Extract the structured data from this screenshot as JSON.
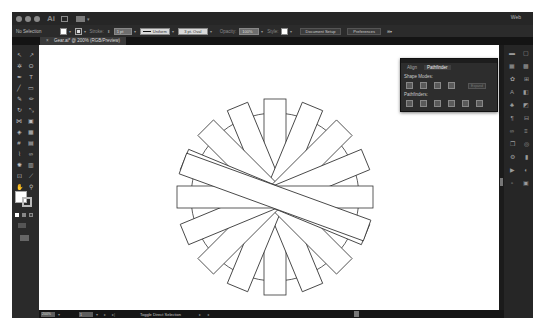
{
  "app": {
    "name": "Ai",
    "workspace": "Web"
  },
  "control_bar": {
    "selection_label": "No Selection",
    "stroke_label": "Stroke:",
    "stroke_value": "1 pt",
    "stroke_profile": "Uniform",
    "brush_value": "3 pt. Oval",
    "opacity_label": "Opacity:",
    "opacity_value": "100%",
    "style_label": "Style:",
    "document_setup_button": "Document Setup",
    "preferences_button": "Preferences"
  },
  "document": {
    "tab_title": "Gear.ai* @ 200% (RGB/Preview)"
  },
  "tools": [
    {
      "icon": "selection-tool",
      "glyph": "↖"
    },
    {
      "icon": "direct-selection-tool",
      "glyph": "↗"
    },
    {
      "icon": "magic-wand-tool",
      "glyph": "✲"
    },
    {
      "icon": "lasso-tool",
      "glyph": "ʘ"
    },
    {
      "icon": "pen-tool",
      "glyph": "✒"
    },
    {
      "icon": "type-tool",
      "glyph": "T"
    },
    {
      "icon": "line-tool",
      "glyph": "╱"
    },
    {
      "icon": "rectangle-tool",
      "glyph": "▭"
    },
    {
      "icon": "paintbrush-tool",
      "glyph": "✎"
    },
    {
      "icon": "pencil-tool",
      "glyph": "✏"
    },
    {
      "icon": "rotate-tool",
      "glyph": "↻"
    },
    {
      "icon": "scale-tool",
      "glyph": "⤡"
    },
    {
      "icon": "width-tool",
      "glyph": "⋈"
    },
    {
      "icon": "free-transform-tool",
      "glyph": "▣"
    },
    {
      "icon": "shape-builder-tool",
      "glyph": "◈"
    },
    {
      "icon": "perspective-grid-tool",
      "glyph": "▦"
    },
    {
      "icon": "mesh-tool",
      "glyph": "#"
    },
    {
      "icon": "gradient-tool",
      "glyph": "▤"
    },
    {
      "icon": "eyedropper-tool",
      "glyph": "⌇"
    },
    {
      "icon": "blend-tool",
      "glyph": "∞"
    },
    {
      "icon": "symbol-sprayer-tool",
      "glyph": "✺"
    },
    {
      "icon": "column-graph-tool",
      "glyph": "▥"
    },
    {
      "icon": "artboard-tool",
      "glyph": "⊡"
    },
    {
      "icon": "slice-tool",
      "glyph": "⟋"
    },
    {
      "icon": "hand-tool",
      "glyph": "✋"
    },
    {
      "icon": "zoom-tool",
      "glyph": "⚲"
    }
  ],
  "right_dock": [
    {
      "icon": "color-panel-icon",
      "glyph": "▬"
    },
    {
      "icon": "artboards-panel-icon",
      "glyph": "▢"
    },
    {
      "icon": "color-guide-icon",
      "glyph": "▦"
    },
    {
      "icon": "swatches-panel-icon",
      "glyph": "▩"
    },
    {
      "icon": "brushes-panel-icon",
      "glyph": "✿"
    },
    {
      "icon": "transform-panel-icon",
      "glyph": "⊞"
    },
    {
      "icon": "character-panel-icon",
      "glyph": "A"
    },
    {
      "icon": "pathfinder-panel-icon",
      "glyph": "◧"
    },
    {
      "icon": "symbols-panel-icon",
      "glyph": "♣"
    },
    {
      "icon": "graphic-styles-icon",
      "glyph": "◩"
    },
    {
      "icon": "paragraph-panel-icon",
      "glyph": "¶"
    },
    {
      "icon": "align-panel-icon",
      "glyph": "⊟"
    },
    {
      "icon": "opentype-panel-icon",
      "glyph": "∞"
    },
    {
      "icon": "stroke-panel-icon",
      "glyph": "≡"
    },
    {
      "icon": "layers-panel-icon",
      "glyph": "❐"
    },
    {
      "icon": "appearance-panel-icon",
      "glyph": "◎"
    },
    {
      "icon": "links-panel-icon",
      "glyph": "⚙"
    },
    {
      "icon": "gradient-panel-icon",
      "glyph": "▮"
    },
    {
      "icon": "actions-panel-icon",
      "glyph": "▶"
    },
    {
      "icon": "transparency-panel-icon",
      "glyph": "◐"
    },
    {
      "icon": "navigator-panel-icon",
      "glyph": "▫"
    },
    {
      "icon": "info-panel-icon",
      "glyph": "▣"
    }
  ],
  "pathfinder_panel": {
    "tabs": [
      "Align",
      "Pathfinder"
    ],
    "active_tab": "Pathfinder",
    "shape_modes_label": "Shape Modes:",
    "expand_button": "Expand",
    "pathfinders_label": "Pathfinders:"
  },
  "status_bar": {
    "zoom": "200%",
    "artboard_number": "1",
    "status_text": "Toggle Direct Selection"
  },
  "artwork": {
    "circle_radius": 84,
    "bar_count": 9,
    "bar_length": 196,
    "bar_width": 22,
    "stroke_color": "#333333",
    "fill_color": "#ffffff"
  }
}
